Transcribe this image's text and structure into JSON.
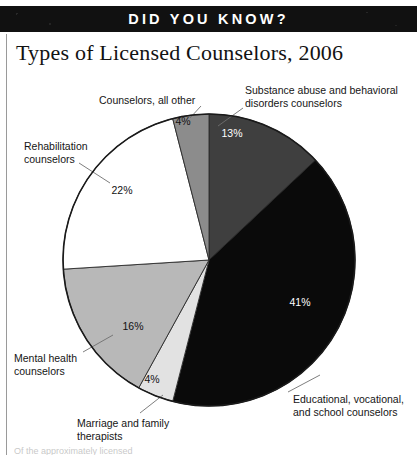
{
  "banner": {
    "text": "DID YOU KNOW?"
  },
  "chart_title": "Types of Licensed Counselors, 2006",
  "bottom_caption_partial": "Of the approximately                   licensed",
  "colors": {
    "banner_background": "#111111",
    "banner_text": "#ffffff",
    "slice_substance_abuse": "#3f3f3f",
    "slice_educational": "#0a0a0a",
    "slice_marriage_family": "#e2e2e2",
    "slice_mental_health": "#b8b8b8",
    "slice_rehabilitation": "#ffffff",
    "slice_all_other": "#8c8c8c",
    "outline": "#1a1a1a",
    "leader_line": "#6f6f6f"
  },
  "chart_data": {
    "type": "pie",
    "title": "Types of Licensed Counselors, 2006",
    "legend_position": "callout-labels",
    "start_angle_deg": 0,
    "direction": "clockwise",
    "center": {
      "x": 209,
      "y": 260
    },
    "radius": 146,
    "categories": [
      "Substance abuse and behavioral disorders counselors",
      "Educational, vocational, and school counselors",
      "Marriage and family therapists",
      "Mental health counselors",
      "Rehabilitation counselors",
      "Counselors, all other"
    ],
    "values": [
      13,
      41,
      4,
      16,
      22,
      4
    ],
    "value_labels": [
      "13%",
      "41%",
      "4%",
      "16%",
      "22%",
      "4%"
    ],
    "unit": "percent",
    "slices": [
      {
        "name": "Substance abuse and behavioral disorders counselors",
        "label": "Substance abuse and behavioral\ndisorders counselors",
        "value": 13,
        "value_label": "13%",
        "color": "#3f3f3f",
        "pct_text_light": true,
        "pct_pos": {
          "x": 232,
          "y": 137
        },
        "label_pos": {
          "x": 245,
          "y": 84
        },
        "leader": {
          "x1": 243,
          "y1": 108,
          "x2": 218,
          "y2": 126
        }
      },
      {
        "name": "Educational, vocational, and school counselors",
        "label": "Educational, vocational,\nand school counselors",
        "value": 41,
        "value_label": "41%",
        "color": "#0a0a0a",
        "pct_text_light": true,
        "pct_pos": {
          "x": 300,
          "y": 306
        },
        "label_pos": {
          "x": 293,
          "y": 393
        },
        "leader": {
          "x1": 288,
          "y1": 392,
          "x2": 320,
          "y2": 375
        }
      },
      {
        "name": "Marriage and family therapists",
        "label": "Marriage and family\ntherapists",
        "value": 4,
        "value_label": "4%",
        "color": "#e2e2e2",
        "pct_text_light": false,
        "pct_pos": {
          "x": 152,
          "y": 383
        },
        "label_pos": {
          "x": 77,
          "y": 417
        },
        "leader": {
          "x1": 140,
          "y1": 413,
          "x2": 163,
          "y2": 395
        }
      },
      {
        "name": "Mental health counselors",
        "label": "Mental health\ncounselors",
        "value": 16,
        "value_label": "16%",
        "color": "#b8b8b8",
        "pct_text_light": false,
        "pct_pos": {
          "x": 133,
          "y": 330
        },
        "label_pos": {
          "x": 14,
          "y": 352
        },
        "leader": {
          "x1": 83,
          "y1": 352,
          "x2": 113,
          "y2": 335
        }
      },
      {
        "name": "Rehabilitation counselors",
        "label": "Rehabilitation\ncounselors",
        "value": 22,
        "value_label": "22%",
        "color": "#ffffff",
        "pct_text_light": false,
        "pct_pos": {
          "x": 122,
          "y": 194
        },
        "label_pos": {
          "x": 24,
          "y": 140
        },
        "leader": {
          "x1": 79,
          "y1": 163,
          "x2": 110,
          "y2": 183
        }
      },
      {
        "name": "Counselors, all other",
        "label": "Counselors, all other",
        "value": 4,
        "value_label": "4%",
        "color": "#8c8c8c",
        "pct_text_light": false,
        "pct_pos": {
          "x": 183,
          "y": 125
        },
        "label_pos": {
          "x": 99,
          "y": 94
        },
        "leader": {
          "x1": 201,
          "y1": 106,
          "x2": 190,
          "y2": 118
        }
      }
    ]
  }
}
